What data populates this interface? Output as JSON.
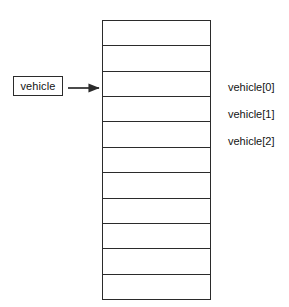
{
  "diagram": {
    "type": "array-pointer-diagram",
    "background_color": "#ffffff",
    "line_color": "#2b2b2b",
    "text_color": "#141414",
    "pointer": {
      "label": "vehicle",
      "box": {
        "x": 13,
        "y": 76,
        "width": 50,
        "height": 20
      },
      "arrow": {
        "name": "pointer-arrow",
        "from_x": 68,
        "to_x": 101,
        "y": 88,
        "direction": "right"
      }
    },
    "array": {
      "name": "vehicle-array",
      "x": 102,
      "y": 20,
      "width": 109,
      "height": 280,
      "cell_count": 11,
      "cells": [
        {
          "index": 0,
          "label": ""
        },
        {
          "index": 1,
          "label": ""
        },
        {
          "index": 2,
          "label": ""
        },
        {
          "index": 3,
          "label": ""
        },
        {
          "index": 4,
          "label": ""
        },
        {
          "index": 5,
          "label": ""
        },
        {
          "index": 6,
          "label": ""
        },
        {
          "index": 7,
          "label": ""
        },
        {
          "index": 8,
          "label": ""
        },
        {
          "index": 9,
          "label": ""
        },
        {
          "index": 10,
          "label": ""
        }
      ]
    },
    "index_labels": [
      {
        "text": "vehicle[0]",
        "x": 228,
        "y": 82
      },
      {
        "text": "vehicle[1]",
        "x": 228,
        "y": 109
      },
      {
        "text": "vehicle[2]",
        "x": 228,
        "y": 136
      }
    ]
  }
}
